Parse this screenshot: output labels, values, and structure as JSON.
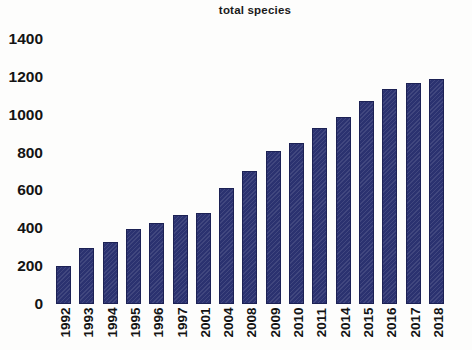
{
  "chart_data": {
    "type": "bar",
    "title": "total species",
    "xlabel": "",
    "ylabel": "",
    "ylim": [
      0,
      1400
    ],
    "ytick_step": 200,
    "yticks": [
      "1400",
      "1200",
      "1000",
      "800",
      "600",
      "400",
      "200",
      "0"
    ],
    "grid": false,
    "legend": null,
    "bar_color": "#2b3270",
    "categories": [
      "1992",
      "1993",
      "1994",
      "1995",
      "1996",
      "1997",
      "2001",
      "2004",
      "2008",
      "2009",
      "2010",
      "2011",
      "2014",
      "2015",
      "2016",
      "2017",
      "2018"
    ],
    "values": [
      200,
      295,
      327,
      395,
      427,
      470,
      480,
      613,
      703,
      808,
      850,
      930,
      990,
      1075,
      1135,
      1165,
      1190
    ]
  }
}
